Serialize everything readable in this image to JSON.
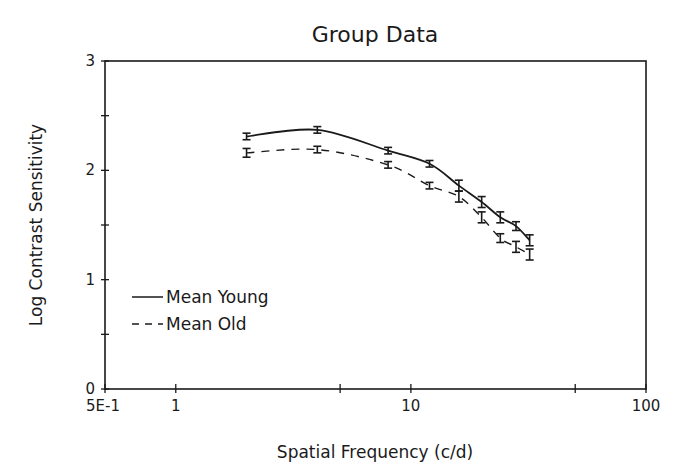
{
  "chart_data": {
    "type": "line",
    "title": "Group Data",
    "xlabel": "Spatial Frequency (c/d)",
    "ylabel": "Log Contrast Sensitivity",
    "xscale": "log",
    "xlim": [
      0.5,
      100
    ],
    "ylim": [
      0,
      3
    ],
    "x_ticks": [
      0.5,
      1,
      5,
      10,
      50,
      100
    ],
    "x_tick_labels": [
      "5E-1",
      "1",
      "",
      "10",
      "",
      "100"
    ],
    "y_ticks": [
      0,
      0.5,
      1,
      1.5,
      2,
      2.5,
      3
    ],
    "y_tick_labels": [
      "0",
      "",
      "1",
      "",
      "2",
      "",
      "3"
    ],
    "grid": false,
    "legend_position": "lower left",
    "x": [
      2,
      4,
      8,
      12,
      16,
      20,
      24,
      28,
      32
    ],
    "series": [
      {
        "name": "Mean Young",
        "line_style": "solid",
        "values": [
          2.31,
          2.37,
          2.18,
          2.06,
          1.86,
          1.71,
          1.57,
          1.49,
          1.36
        ],
        "error": [
          0.03,
          0.03,
          0.03,
          0.03,
          0.05,
          0.05,
          0.05,
          0.04,
          0.05
        ]
      },
      {
        "name": "Mean Old",
        "line_style": "dashed",
        "values": [
          2.16,
          2.19,
          2.05,
          1.86,
          1.76,
          1.57,
          1.38,
          1.3,
          1.23
        ],
        "error": [
          0.04,
          0.03,
          0.03,
          0.03,
          0.05,
          0.05,
          0.04,
          0.05,
          0.05
        ]
      }
    ]
  },
  "legend": {
    "items": [
      {
        "label": "Mean Young"
      },
      {
        "label": "Mean Old"
      }
    ]
  }
}
